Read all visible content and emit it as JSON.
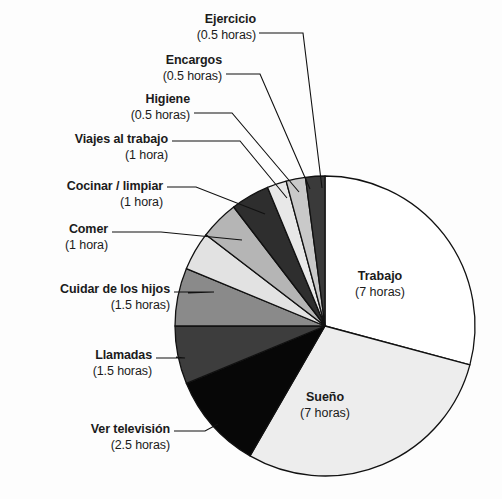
{
  "chart_data": {
    "type": "pie",
    "title": "",
    "subtitle": "",
    "units": "horas",
    "total_hours": 24,
    "legend_position": "none",
    "labels_inside": [
      "Trabajo",
      "Sueño"
    ],
    "start_angle_deg": 0,
    "direction": "clockwise",
    "categories": [
      "Trabajo",
      "Sueño",
      "Ver televisión",
      "Llamadas",
      "Cuidar de los hijos",
      "Comer",
      "Cocinar / limpiar",
      "Viajes al trabajo",
      "Higiene",
      "Encargos",
      "Ejercicio"
    ],
    "values": [
      7,
      7,
      2.5,
      1.5,
      1.5,
      1,
      1,
      1,
      0.5,
      0.5,
      0.5
    ],
    "value_labels": [
      "(7 horas)",
      "(7 horas)",
      "(2.5 horas)",
      "(1.5 horas)",
      "(1.5 horas)",
      "(1 hora)",
      "(1 hora)",
      "(1 hora)",
      "(0.5 horas)",
      "(0.5 horas)",
      "(0.5 horas)"
    ],
    "colors": [
      "#ffffff",
      "#ededed",
      "#070707",
      "#3d3d3d",
      "#8a8a8a",
      "#e2e2e2",
      "#b5b5b5",
      "#2e2e2e",
      "#e8e8e8",
      "#c9c9c9",
      "#3a3a3a"
    ],
    "slice_stroke": "#111111",
    "xlabel": "",
    "ylabel": ""
  },
  "geometry": {
    "center_x": 325,
    "center_y": 326,
    "radius": 150
  },
  "slices": [
    {
      "name": "trabajo",
      "label": "Trabajo",
      "hours_text": "(7 horas)",
      "label_left": 355,
      "label_top": 268
    },
    {
      "name": "sueno",
      "label": "Sueño",
      "hours_text": "(7 horas)",
      "label_left": 300,
      "label_top": 389
    }
  ],
  "callouts": [
    {
      "name": "ejercicio",
      "label": "Ejercicio",
      "hours_text": "(0.5 horas)",
      "text_right": 256,
      "text_top": 11,
      "leader": [
        [
          259,
          33
        ],
        [
          303,
          33
        ],
        [
          322,
          188
        ]
      ]
    },
    {
      "name": "encargos",
      "label": "Encargos",
      "hours_text": "(0.5 horas)",
      "text_right": 222,
      "text_top": 52,
      "leader": [
        [
          226,
          74
        ],
        [
          260,
          74
        ],
        [
          310,
          189
        ]
      ]
    },
    {
      "name": "higiene",
      "label": "Higiene",
      "hours_text": "(0.5 horas)",
      "text_right": 190,
      "text_top": 91,
      "leader": [
        [
          194,
          113
        ],
        [
          232,
          113
        ],
        [
          299,
          192
        ]
      ]
    },
    {
      "name": "viajes-al-trabajo",
      "label": "Viajes al trabajo",
      "hours_text": "(1 hora)",
      "text_right": 168,
      "text_top": 131,
      "leader": [
        [
          172,
          141
        ],
        [
          240,
          141
        ],
        [
          287,
          198
        ]
      ]
    },
    {
      "name": "cocinar-limpiar",
      "label": "Cocinar / limpiar",
      "hours_text": "(1 hora)",
      "text_right": 163,
      "text_top": 178,
      "leader": [
        [
          167,
          187
        ],
        [
          196,
          187
        ],
        [
          265,
          214
        ]
      ]
    },
    {
      "name": "comer",
      "label": "Comer",
      "hours_text": "(1 hora)",
      "text_right": 108,
      "text_top": 221,
      "leader": [
        [
          112,
          232
        ],
        [
          161,
          232
        ],
        [
          242,
          240
        ]
      ]
    },
    {
      "name": "cuidar-de-los-hijos",
      "label": "Cuidar de los hijos",
      "hours_text": "(1.5 horas)",
      "text_right": 170,
      "text_top": 281,
      "leader": [
        [
          174,
          292
        ],
        [
          214,
          292
        ],
        [
          188,
          293
        ]
      ]
    },
    {
      "name": "llamadas",
      "label": "Llamadas",
      "hours_text": "(1.5 horas)",
      "text_right": 152,
      "text_top": 347,
      "leader": [
        [
          156,
          358
        ],
        [
          185,
          358
        ],
        [
          176,
          357
        ]
      ]
    },
    {
      "name": "ver-television",
      "label": "Ver televisión",
      "hours_text": "(2.5 horas)",
      "text_right": 170,
      "text_top": 421,
      "leader": [
        [
          174,
          431
        ],
        [
          205,
          431
        ],
        [
          218,
          424
        ]
      ]
    }
  ]
}
